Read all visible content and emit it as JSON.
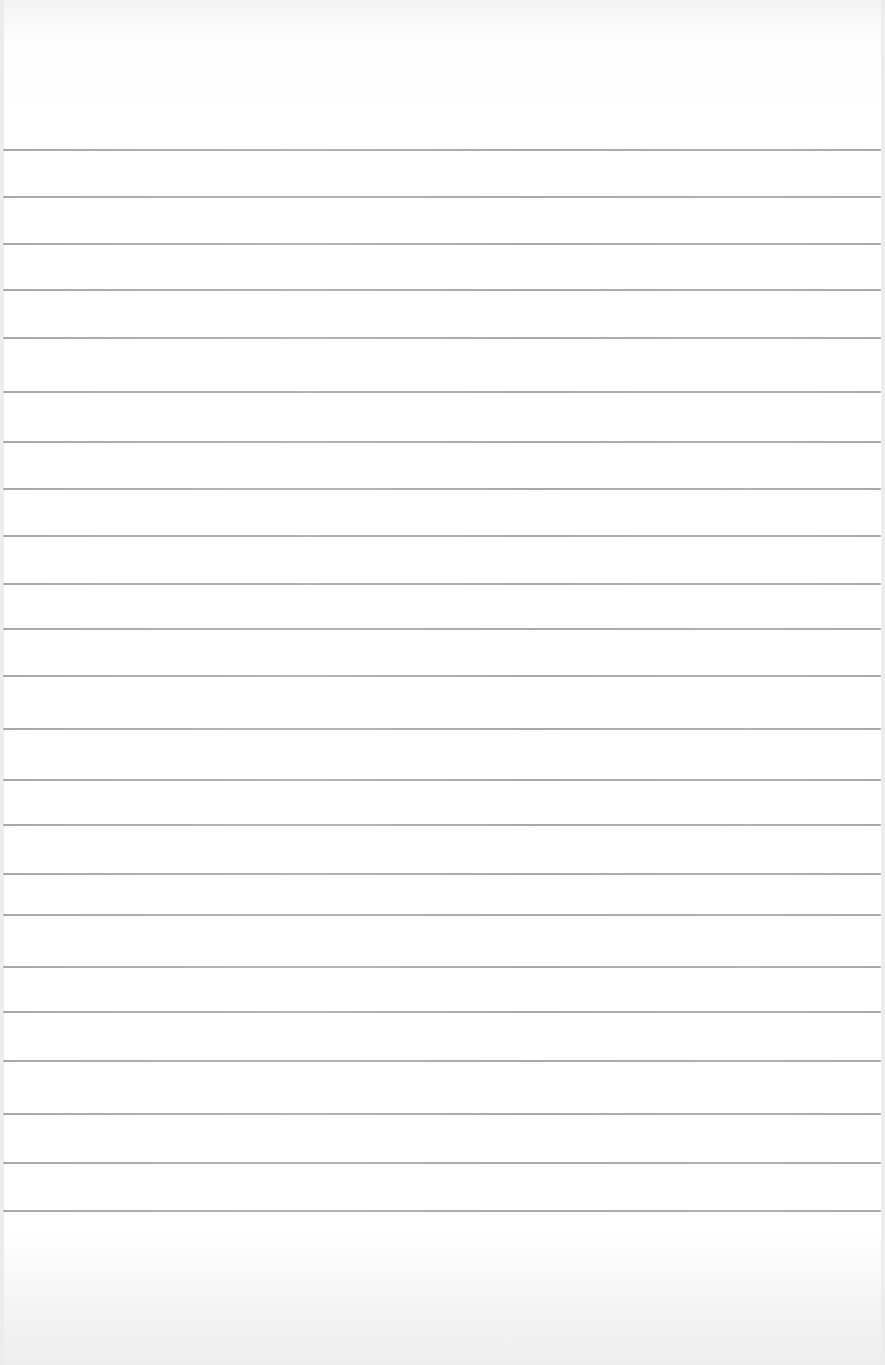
{
  "page": {
    "type": "blank lined paper",
    "background_color": "#ffffff",
    "rule_color": "#a9a9a9",
    "rule_count": 23,
    "rule_y_positions": [
      150,
      197,
      244,
      290,
      338,
      392,
      442,
      489,
      536,
      584,
      629,
      676,
      729,
      780,
      825,
      874,
      915,
      967,
      1012,
      1061,
      1114,
      1163,
      1211
    ]
  }
}
